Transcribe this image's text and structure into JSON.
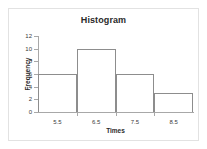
{
  "chart_data": {
    "type": "bar",
    "title": "Histogram",
    "xlabel": "Times",
    "ylabel": "Frequency",
    "categories": [
      "5.5",
      "6.5",
      "7.5",
      "8.5"
    ],
    "values": [
      6,
      10,
      6,
      3
    ],
    "bin_edges": [
      5.0,
      6.0,
      7.0,
      8.0,
      9.0
    ],
    "xticks": [
      "5.5",
      "6.5",
      "7.5",
      "8.5"
    ],
    "yticks": [
      "0",
      "2",
      "4",
      "6",
      "8",
      "10",
      "12"
    ],
    "ytick_values": [
      0,
      2,
      4,
      6,
      8,
      10,
      12
    ],
    "ylim": [
      0,
      12
    ],
    "xlim": [
      5.0,
      9.0
    ],
    "grid": false,
    "legend": false,
    "bar_fill_color": "#ffffff",
    "bar_edge_color": "#8d8d8d",
    "axis_color": "#a8a8a8",
    "text_color": "#2a2a2a",
    "background_color": "#ffffff",
    "frame_color": "#e2e2e2"
  }
}
